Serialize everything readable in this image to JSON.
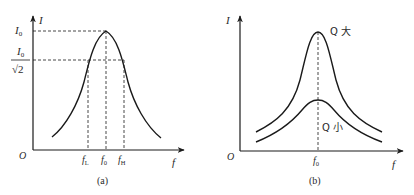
{
  "panel_a": {
    "caption": "(a)",
    "y_axis_label": "I",
    "x_axis_label": "f",
    "origin_label": "O",
    "y_ticks": {
      "peak": "I",
      "peak_sub": "0",
      "half_power_num": "I",
      "half_power_num_sub": "0",
      "half_power_den": "√2"
    },
    "x_ticks": {
      "low": "f",
      "low_sub": "L",
      "center": "f",
      "center_sub": "0",
      "high": "f",
      "high_sub": "H"
    }
  },
  "panel_b": {
    "caption": "(b)",
    "y_axis_label": "I",
    "x_axis_label": "f",
    "origin_label": "O",
    "x_ticks": {
      "center": "f",
      "center_sub": "0"
    },
    "curve_labels": {
      "high_q": "Q 大",
      "low_q": "Q 小"
    }
  },
  "colors": {
    "line": "#1a1a1a",
    "text": "#2a2a2a",
    "background": "#ffffff"
  }
}
